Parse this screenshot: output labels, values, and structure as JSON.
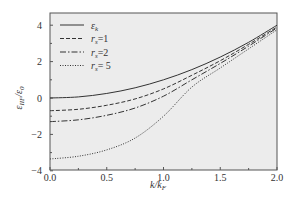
{
  "chart_data": {
    "type": "line",
    "title": "",
    "xlabel": "k/k_F",
    "ylabel": "ε_IIF/ε_0",
    "xlim": [
      0.0,
      2.0
    ],
    "ylim": [
      -4,
      4.6
    ],
    "xticks": [
      "0.0",
      "0.5",
      "1.0",
      "1.5",
      "2.0"
    ],
    "yticks": [
      "-4",
      "-2",
      "0",
      "2",
      "4"
    ],
    "grid": false,
    "legend_position": "upper left",
    "x": [
      0.0,
      0.25,
      0.5,
      0.75,
      1.0,
      1.25,
      1.5,
      1.75,
      2.0
    ],
    "series": [
      {
        "name": "ε_k",
        "style": "solid",
        "values": [
          0.0,
          0.06,
          0.25,
          0.56,
          1.0,
          1.56,
          2.25,
          3.06,
          4.0
        ]
      },
      {
        "name": "r_s=1",
        "style": "dashed",
        "values": [
          -0.7,
          -0.62,
          -0.4,
          -0.05,
          0.5,
          1.25,
          2.05,
          2.95,
          3.9
        ]
      },
      {
        "name": "r_s=2",
        "style": "dashdot",
        "values": [
          -1.3,
          -1.2,
          -0.95,
          -0.55,
          0.1,
          1.0,
          1.9,
          2.85,
          3.85
        ]
      },
      {
        "name": "r_s=5",
        "style": "dotted",
        "values": [
          -3.35,
          -3.2,
          -2.85,
          -2.2,
          -1.0,
          0.6,
          1.65,
          2.7,
          3.75
        ]
      }
    ]
  },
  "legend": {
    "items": [
      {
        "label": "ε",
        "sub": "k"
      },
      {
        "label": "r",
        "sub": "s",
        "suffix": "=1"
      },
      {
        "label": "r",
        "sub": "s",
        "suffix": "=2"
      },
      {
        "label": "r",
        "sub": "s",
        "suffix": "= 5"
      }
    ]
  },
  "axes": {
    "x_label_main": "k/k",
    "x_label_sub": "F",
    "y_label_main": "ε",
    "y_label_sub1": "IIF",
    "y_label_mid": "/ε",
    "y_label_sub2": "0"
  },
  "colors": {
    "plot_bg": "#ececec",
    "frame": "#555555",
    "line": "#333333"
  }
}
